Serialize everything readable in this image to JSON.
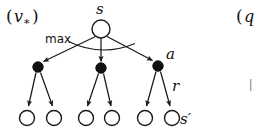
{
  "figure": {
    "name": "backup-diagram-v-star",
    "width": 260,
    "height": 129,
    "background_color": "#ffffff",
    "ink_color": "#1a1a1a"
  },
  "labels": {
    "left_caption_open_paren": "(",
    "left_caption_var": "v",
    "left_caption_subscript": "∗",
    "left_caption_close_paren": ")",
    "left_caption_full": "(v∗)",
    "root_state": "s",
    "max_operator": "max",
    "action": "a",
    "reward": "r",
    "next_state": "s′",
    "right_caption_open_paren": "(",
    "right_caption_var": "q",
    "right_caption_full": "(q"
  },
  "nodes": {
    "root": {
      "id": "s",
      "kind": "state",
      "label": "s",
      "cx": 101,
      "cy": 29,
      "r": 9
    },
    "actions": [
      {
        "id": "a1",
        "kind": "action",
        "label": "",
        "cx": 38,
        "cy": 67,
        "r": 5.2
      },
      {
        "id": "a2",
        "kind": "action",
        "label": "",
        "cx": 101,
        "cy": 68,
        "r": 5.2
      },
      {
        "id": "a3",
        "kind": "action",
        "label": "a",
        "cx": 158,
        "cy": 66,
        "r": 5.2
      }
    ],
    "next_states": [
      {
        "id": "s1",
        "kind": "state",
        "label": "",
        "cx": 27,
        "cy": 118,
        "r": 7.5
      },
      {
        "id": "s2",
        "kind": "state",
        "label": "",
        "cx": 54,
        "cy": 118,
        "r": 7.5
      },
      {
        "id": "s3",
        "kind": "state",
        "label": "",
        "cx": 86,
        "cy": 118,
        "r": 7.5
      },
      {
        "id": "s4",
        "kind": "state",
        "label": "",
        "cx": 112,
        "cy": 118,
        "r": 7.5
      },
      {
        "id": "s5",
        "kind": "state",
        "label": "",
        "cx": 145,
        "cy": 118,
        "r": 7.5
      },
      {
        "id": "s6",
        "kind": "state",
        "label": "s′",
        "cx": 172,
        "cy": 118,
        "r": 7.5
      }
    ]
  },
  "edges": {
    "state_to_action_count": 3,
    "action_to_state_count": 6,
    "arrowheads": "filled-triangle"
  },
  "annotations": {
    "max_arc_present": true,
    "max_arc_description": "arc spanning the three action branches under the root state"
  },
  "colors": {
    "stroke": "#1a1a1a",
    "state_fill": "#ffffff",
    "action_fill": "#111111",
    "text": "#111111",
    "clipped_text": "#8a8a8a"
  }
}
